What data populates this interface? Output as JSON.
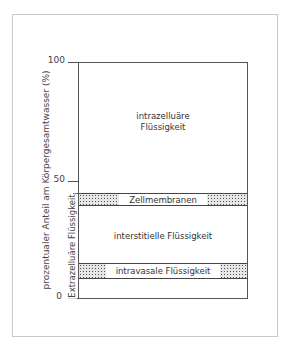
{
  "figure": {
    "y_axis_label": "prozentualer Anteil am Körpergesamtwasser (%)",
    "ticks": [
      {
        "value": 100,
        "label": "100"
      },
      {
        "value": 50,
        "label": "50"
      },
      {
        "value": 0,
        "label": "0"
      }
    ],
    "bracket_label": "Extrazelluäre Flüssigkeit",
    "compartments": [
      {
        "name": "intrazelluäre Flüssigkeit",
        "label_line1": "intrazelluäre",
        "label_line2": "Flüssigkeit",
        "from": 45,
        "to": 100
      },
      {
        "name": "Zellmembranen",
        "label": "Zellmembranen",
        "from": 40,
        "to": 45,
        "hatched": true
      },
      {
        "name": "interstitielle Flüssigkeit",
        "label": "interstitielle Flüssigkeit",
        "from": 15,
        "to": 40
      },
      {
        "name": "intravasale Flüssigkeit",
        "label": "intravasale Flüssigkeit",
        "from": 8,
        "to": 15,
        "hatched": true
      },
      {
        "name": "unlabeled",
        "from": 0,
        "to": 8
      }
    ]
  }
}
